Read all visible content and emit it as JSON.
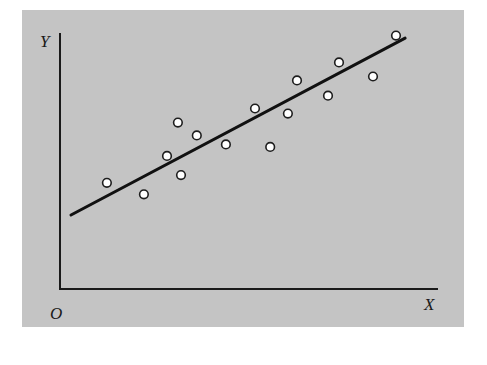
{
  "chart_data": {
    "type": "scatter",
    "title": "",
    "xlabel": "X",
    "ylabel": "Y",
    "origin_label": "O",
    "grid": false,
    "legend": null,
    "tick_labels": false,
    "background_color": "#c4c4c4",
    "point_style": "hollow white circle",
    "xlim": [
      0,
      100
    ],
    "ylim": [
      0,
      100
    ],
    "points": [
      {
        "x": 12.4,
        "y": 41.5
      },
      {
        "x": 22.2,
        "y": 37.0
      },
      {
        "x": 28.3,
        "y": 52.0
      },
      {
        "x": 31.2,
        "y": 65.0
      },
      {
        "x": 32.0,
        "y": 44.5
      },
      {
        "x": 36.2,
        "y": 60.0
      },
      {
        "x": 43.9,
        "y": 56.5
      },
      {
        "x": 51.6,
        "y": 70.5
      },
      {
        "x": 55.6,
        "y": 55.5
      },
      {
        "x": 60.3,
        "y": 68.5
      },
      {
        "x": 62.7,
        "y": 81.5
      },
      {
        "x": 70.9,
        "y": 75.5
      },
      {
        "x": 73.8,
        "y": 88.5
      },
      {
        "x": 82.8,
        "y": 83.0
      },
      {
        "x": 88.9,
        "y": 99.0
      }
    ],
    "trend_line": {
      "type": "linear regression",
      "x_start": 2.9,
      "y_start": 28.9,
      "x_end": 91.3,
      "y_end": 98.0
    }
  },
  "labels": {
    "y_axis": "Y",
    "x_axis": "X",
    "origin": "O"
  }
}
